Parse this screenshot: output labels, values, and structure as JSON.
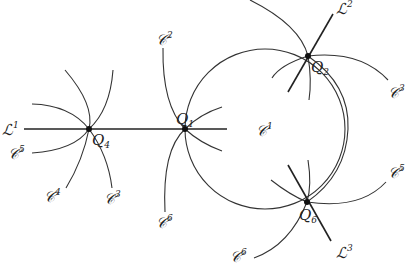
{
  "diagram": {
    "points": [
      {
        "name": "Q",
        "sub": "1",
        "x": 185,
        "y": 129
      },
      {
        "name": "Q",
        "sub": "2",
        "x": 308,
        "y": 56
      },
      {
        "name": "Q",
        "sub": "4",
        "x": 89,
        "y": 129
      },
      {
        "name": "Q",
        "sub": "6",
        "x": 307,
        "y": 202
      }
    ],
    "labels": {
      "L1": {
        "base": "ℒ",
        "sup": "1"
      },
      "L2": {
        "base": "ℒ",
        "sup": "2"
      },
      "L3": {
        "base": "ℒ",
        "sup": "3"
      },
      "C1_center": {
        "base": "𝒞",
        "sup": "1"
      },
      "C2_q1": {
        "base": "𝒞",
        "sup": "2"
      },
      "C6_q1": {
        "base": "𝒞",
        "sup": "6"
      },
      "C5_q4": {
        "base": "𝒞",
        "sup": "5"
      },
      "C4_q4": {
        "base": "𝒞",
        "sup": "4"
      },
      "C3_q4": {
        "base": "𝒞",
        "sup": "3"
      },
      "C3_q2": {
        "base": "𝒞",
        "sup": "3"
      },
      "C5_q6": {
        "base": "𝒞",
        "sup": "5"
      },
      "C6_q6": {
        "base": "𝒞",
        "sup": "6"
      }
    }
  }
}
